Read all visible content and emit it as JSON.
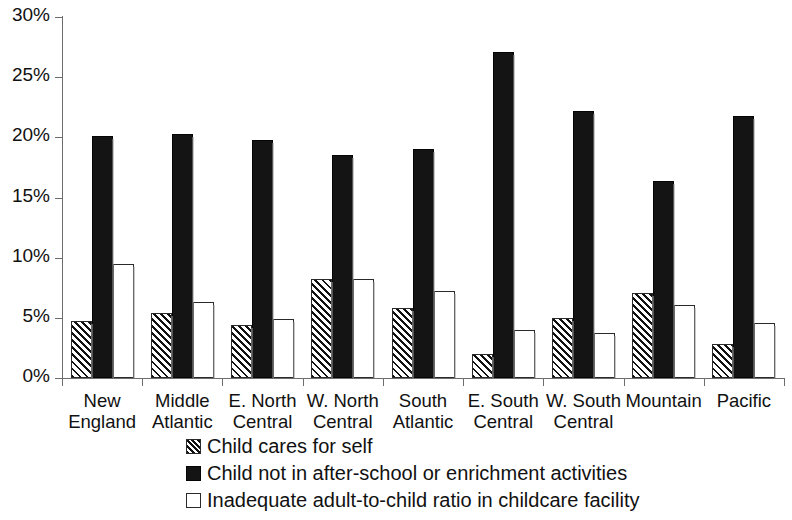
{
  "chart_data": {
    "type": "bar",
    "title": "",
    "xlabel": "",
    "ylabel": "",
    "ylim": [
      0,
      30
    ],
    "ytick_labels": [
      "30%",
      "25%",
      "20%",
      "15%",
      "10%",
      "5%",
      "0%"
    ],
    "ytick_values": [
      30,
      25,
      20,
      15,
      10,
      5,
      0
    ],
    "grid": false,
    "legend_position": "bottom",
    "categories": [
      "New\nEngland",
      "Middle\nAtlantic",
      "E. North\nCentral",
      "W. North\nCentral",
      "South\nAtlantic",
      "E. South\nCentral",
      "W. South\nCentral",
      "Mountain",
      "Pacific"
    ],
    "series": [
      {
        "name": "Child cares for self",
        "style": "hatched",
        "values": [
          4.7,
          5.4,
          4.4,
          8.2,
          5.8,
          2.0,
          5.0,
          7.1,
          2.8
        ]
      },
      {
        "name": "Child not in after-school or enrichment activities",
        "style": "black",
        "values": [
          20.1,
          20.3,
          19.8,
          18.5,
          19.0,
          27.1,
          22.2,
          16.4,
          21.8
        ]
      },
      {
        "name": "Inadequate adult-to-child ratio in childcare facility",
        "style": "white",
        "values": [
          9.5,
          6.3,
          4.9,
          8.2,
          7.2,
          4.0,
          3.7,
          6.1,
          4.6
        ]
      }
    ]
  },
  "colors": {
    "axis": "#6d6d6d",
    "text": "#111111",
    "black_series": "#141414",
    "white_series": "#ffffff",
    "hatch_ink": "#111111"
  }
}
